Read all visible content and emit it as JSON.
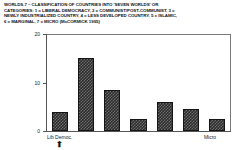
{
  "caption": {
    "line1": "WORLDS.7 – CLASSIFICATION OF COUNTRIES INTO 'SEVEN WORLDS' OR",
    "line2": "CATEGORIES: 1 = LIBERAL DEMOCRACY, 2 = COMMUNIST/POST-COMMUNIST, 3 =",
    "line3": "NEWLY INDUSTRIALIZED COUNTRY, 4 = LESS DEVELOPED COUNTRY, 5 = ISLAMIC,",
    "line4": "6 = MARGINAL, 7 = MICRO (McCORMICK 1995)"
  },
  "marker": {
    "glyph": "⬆"
  },
  "chart_data": {
    "type": "bar",
    "title": "",
    "xlabel": "",
    "ylabel": "",
    "categories": [
      "1",
      "2",
      "3",
      "4",
      "5",
      "6",
      "7"
    ],
    "category_labels": [
      "Lib Democ.",
      "",
      "",
      "",
      "",
      "",
      "Micro"
    ],
    "values": [
      4,
      15,
      8.5,
      2.5,
      6,
      4.5,
      2.5
    ],
    "ylim": [
      0,
      20
    ],
    "yticks": [
      0,
      10,
      20
    ],
    "ytick_labels": [
      "0",
      "10",
      "20"
    ],
    "grid": false,
    "legend": "none",
    "bar_color": "#2b2b2b"
  }
}
